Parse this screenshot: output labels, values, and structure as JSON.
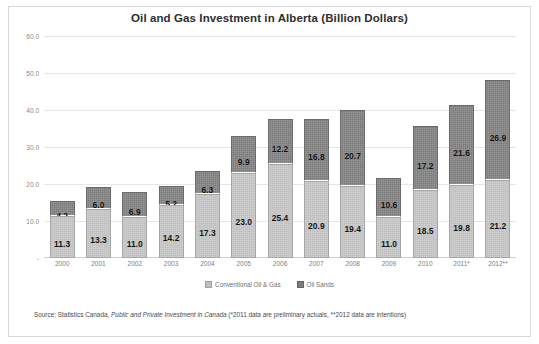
{
  "chart_data": {
    "type": "bar",
    "subtype": "stacked-column",
    "title": "Oil and Gas Investment in Alberta (Billion Dollars)",
    "xlabel": "",
    "ylabel": "",
    "ylim": [
      0,
      60
    ],
    "ytick_labels": [
      "60.0",
      "50.0",
      "40.0",
      "30.0",
      "20.0",
      "10.0",
      "-"
    ],
    "ytick_values": [
      60,
      50,
      40,
      30,
      20,
      10,
      0
    ],
    "grid": true,
    "legend_position": "bottom",
    "categories": [
      "2000",
      "2001",
      "2002",
      "2003",
      "2004",
      "2005",
      "2006",
      "2007",
      "2008",
      "2009",
      "2010",
      "2011*",
      "2012**"
    ],
    "series": [
      {
        "name": "Conventional Oil & Gas",
        "color": "#bfbfbf",
        "values": [
          11.3,
          13.3,
          11.0,
          14.2,
          17.3,
          23.0,
          25.4,
          20.9,
          19.4,
          11.0,
          18.5,
          19.8,
          21.2
        ]
      },
      {
        "name": "Oil Sands",
        "color": "#7b7b7b",
        "values": [
          4.2,
          6.0,
          6.9,
          5.2,
          6.3,
          9.9,
          12.2,
          16.8,
          20.7,
          10.6,
          17.2,
          21.6,
          26.9
        ]
      }
    ],
    "totals": [
      15.5,
      19.3,
      17.9,
      19.4,
      23.6,
      32.9,
      37.6,
      37.7,
      40.1,
      21.6,
      35.7,
      41.4,
      48.1
    ],
    "source_note": {
      "prefix": "Source: Statistics Canada, ",
      "italic": "Public and Private Investment in Canada",
      "suffix": " (*2011 data are preliminary actuals, **2012 data  are intentions)"
    }
  }
}
